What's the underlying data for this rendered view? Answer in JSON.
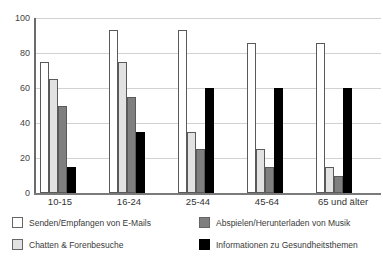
{
  "chart_data": {
    "type": "bar",
    "title": "",
    "subtitle": "",
    "xlabel": "",
    "ylabel": "",
    "ylim": [
      0,
      100
    ],
    "yticks": [
      0,
      20,
      40,
      60,
      80,
      100
    ],
    "ytick_labels": [
      "0",
      "20",
      "40",
      "60",
      "80",
      "100"
    ],
    "grid": true,
    "legend_position": "bottom",
    "categories": [
      "10-15",
      "16-24",
      "25-44",
      "45-64",
      "65 und älter"
    ],
    "series": [
      {
        "name": "Senden/Empfangen von E-Mails",
        "color": "#ffffff",
        "values": [
          75,
          93,
          93,
          86,
          86
        ]
      },
      {
        "name": "Chatten & Forenbesuche",
        "color": "#e2e2e2",
        "values": [
          65,
          75,
          35,
          25,
          15
        ]
      },
      {
        "name": "Abspielen/Herunterladen von Musik",
        "color": "#7f7f7f",
        "values": [
          50,
          55,
          25,
          15,
          10
        ]
      },
      {
        "name": "Informationen zu Gesundheitsthemen",
        "color": "#000000",
        "values": [
          15,
          35,
          60,
          60,
          60
        ]
      }
    ]
  },
  "axis": {
    "y_ticks": [
      "100",
      "80",
      "60",
      "40",
      "20",
      "0"
    ]
  },
  "xaxis": {
    "labels": [
      "10-15",
      "16-24",
      "25-44",
      "45-64",
      "65 und älter"
    ]
  },
  "legend": {
    "entries": [
      {
        "label": "Senden/Empfangen von E-Mails",
        "swatch": "white-square-swatch"
      },
      {
        "label": "Chatten & Forenbesuche",
        "swatch": "light-gray-square-swatch"
      },
      {
        "label": "Abspielen/Herunterladen von Musik",
        "swatch": "dark-gray-square-swatch"
      },
      {
        "label": "Informationen zu Gesundheitsthemen",
        "swatch": "black-square-swatch"
      }
    ]
  }
}
